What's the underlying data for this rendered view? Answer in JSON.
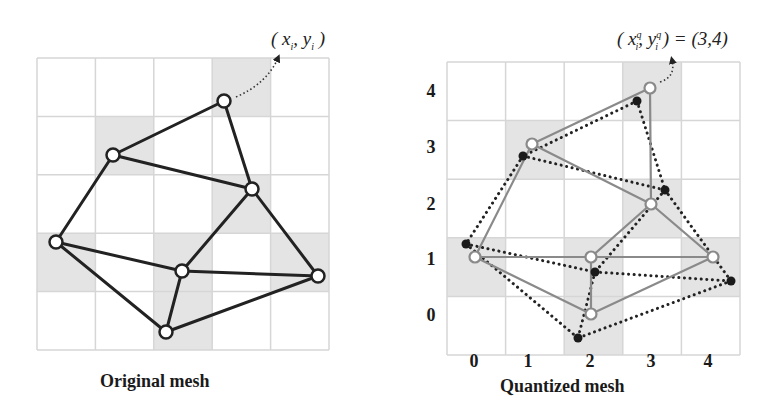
{
  "figure": {
    "colors": {
      "grid_line": "#d6d6d6",
      "cell_shade": "#e4e4e4",
      "original_edge": "#222222",
      "quantized_edge": "#8a8a8a",
      "dotted_edge": "#222222",
      "vertex_fill": "#ffffff",
      "dot_fill": "#1a1a1a"
    },
    "left_panel": {
      "caption": "Original mesh",
      "annotation": {
        "prefix": "( x",
        "sub1": "i",
        "mid": ", y",
        "sub2": "i",
        "suffix": " )"
      },
      "grid": {
        "x0": 37,
        "y0": 58,
        "cell": 58.4,
        "cols": 5,
        "rows": 5
      },
      "shaded_cells": [
        [
          3,
          0
        ],
        [
          1,
          1
        ],
        [
          3,
          2
        ],
        [
          0,
          3
        ],
        [
          2,
          3
        ],
        [
          4,
          3
        ],
        [
          2,
          4
        ]
      ],
      "vertices": [
        [
          224,
          101
        ],
        [
          113,
          155
        ],
        [
          252,
          189
        ],
        [
          56,
          242
        ],
        [
          182,
          271
        ],
        [
          318,
          276
        ],
        [
          166,
          332
        ]
      ],
      "edges": [
        [
          0,
          1
        ],
        [
          0,
          2
        ],
        [
          1,
          2
        ],
        [
          1,
          3
        ],
        [
          2,
          4
        ],
        [
          2,
          5
        ],
        [
          3,
          4
        ],
        [
          3,
          6
        ],
        [
          4,
          5
        ],
        [
          4,
          6
        ],
        [
          5,
          6
        ]
      ],
      "pointer": {
        "from": [
          236,
          97
        ],
        "to": [
          278,
          58
        ]
      }
    },
    "right_panel": {
      "caption": "Quantized mesh",
      "annotation": {
        "prefix": "( x",
        "sup1": "q",
        "sub1": "i",
        "mid": ", y",
        "sup2": "q",
        "sub2": "i",
        "suffix": " ) = (3,4)"
      },
      "grid": {
        "x0": 447,
        "y0": 62,
        "cell": 58.6,
        "cols": 5,
        "rows": 5
      },
      "shaded_cells": [
        [
          3,
          0
        ],
        [
          1,
          1
        ],
        [
          3,
          2
        ],
        [
          0,
          3
        ],
        [
          2,
          3
        ],
        [
          4,
          3
        ],
        [
          2,
          4
        ]
      ],
      "x_ticks": [
        "0",
        "1",
        "2",
        "3",
        "4"
      ],
      "y_ticks": [
        "4",
        "3",
        "2",
        "1",
        "0"
      ],
      "quantized_vertices": [
        [
          650,
          88
        ],
        [
          532,
          144
        ],
        [
          651,
          204
        ],
        [
          475,
          257
        ],
        [
          591,
          257
        ],
        [
          713,
          257
        ],
        [
          591,
          314
        ]
      ],
      "original_vertices": [
        [
          637,
          101
        ],
        [
          523,
          156
        ],
        [
          665,
          190
        ],
        [
          466,
          244
        ],
        [
          595,
          272
        ],
        [
          731,
          281
        ],
        [
          578,
          338
        ]
      ],
      "edges": [
        [
          0,
          1
        ],
        [
          0,
          2
        ],
        [
          1,
          2
        ],
        [
          1,
          3
        ],
        [
          2,
          4
        ],
        [
          2,
          5
        ],
        [
          3,
          4
        ],
        [
          3,
          6
        ],
        [
          4,
          5
        ],
        [
          4,
          6
        ],
        [
          5,
          6
        ]
      ],
      "pointer": {
        "from": [
          660,
          82
        ],
        "to": [
          672,
          60
        ]
      }
    }
  }
}
